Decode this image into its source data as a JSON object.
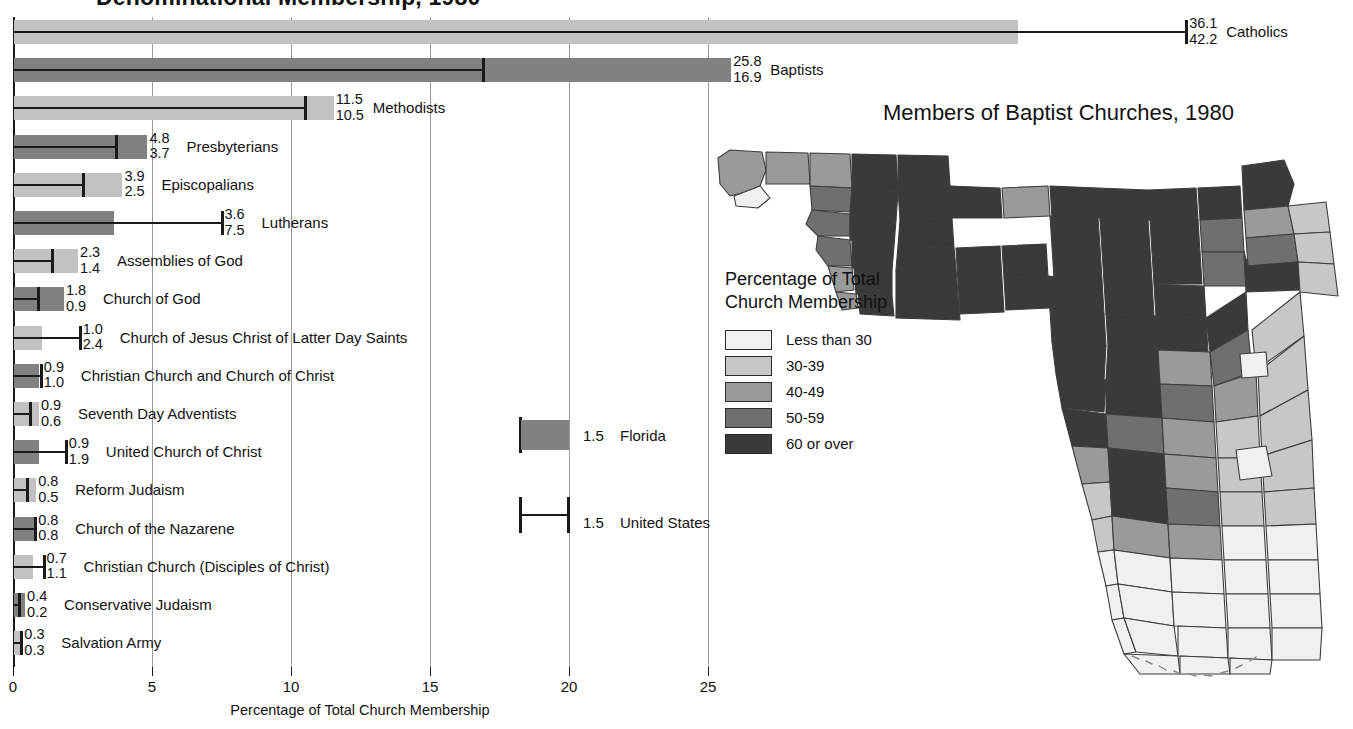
{
  "chart_data": {
    "type": "bar",
    "title": "Denominational Membership, 1980",
    "xlabel": "Percentage of Total Church Membership",
    "ylabel": "",
    "xlim": [
      0,
      26.5
    ],
    "xticks": [
      0,
      5,
      10,
      15,
      20,
      25
    ],
    "xticklabels": [
      "0",
      "5",
      "10",
      "15",
      "20",
      "25"
    ],
    "grid": true,
    "legend_position": "inside-center-right",
    "series": [
      {
        "name": "Florida",
        "kind": "bar"
      },
      {
        "name": "United States",
        "kind": "whisker-line"
      }
    ],
    "categories": [
      "Catholics",
      "Baptists",
      "Methodists",
      "Presbyterians",
      "Episcopalians",
      "Lutherans",
      "Assemblies of God",
      "Church of God",
      "Church of Jesus Christ of Latter Day Saints",
      "Christian Church and Church of Christ",
      "Seventh Day Adventists",
      "United Church of Christ",
      "Reform Judaism",
      "Church of the Nazarene",
      "Christian Church (Disciples of Christ)",
      "Conservative Judaism",
      "Salvation Army"
    ],
    "florida": [
      36.1,
      25.8,
      11.5,
      4.8,
      3.9,
      3.6,
      2.3,
      1.8,
      1.0,
      0.9,
      0.9,
      0.9,
      0.8,
      0.8,
      0.7,
      0.4,
      0.3
    ],
    "united_states": [
      42.2,
      16.9,
      10.5,
      3.7,
      2.5,
      7.5,
      1.4,
      0.9,
      2.4,
      1.0,
      0.6,
      1.9,
      0.5,
      0.8,
      1.1,
      0.2,
      0.3
    ]
  },
  "chart": {
    "title": "Denominational Membership, 1980",
    "x_axis_title": "Percentage of Total Church Membership",
    "ticks": [
      "0",
      "5",
      "10",
      "15",
      "20",
      "25"
    ],
    "rows": [
      {
        "label": "Catholics",
        "v1": "36.1",
        "v2": "42.2",
        "shade": "light"
      },
      {
        "label": "Baptists",
        "v1": "25.8",
        "v2": "16.9",
        "shade": "dark"
      },
      {
        "label": "Methodists",
        "v1": "11.5",
        "v2": "10.5",
        "shade": "light"
      },
      {
        "label": "Presbyterians",
        "v1": "4.8",
        "v2": "3.7",
        "shade": "dark"
      },
      {
        "label": "Episcopalians",
        "v1": "3.9",
        "v2": "2.5",
        "shade": "light"
      },
      {
        "label": "Lutherans",
        "v1": "3.6",
        "v2": "7.5",
        "shade": "dark"
      },
      {
        "label": "Assemblies of God",
        "v1": "2.3",
        "v2": "1.4",
        "shade": "light"
      },
      {
        "label": "Church of God",
        "v1": "1.8",
        "v2": "0.9",
        "shade": "dark"
      },
      {
        "label": "Church of Jesus Christ of Latter Day Saints",
        "v1": "1.0",
        "v2": "2.4",
        "shade": "light"
      },
      {
        "label": "Christian Church and Church of Christ",
        "v1": "0.9",
        "v2": "1.0",
        "shade": "dark"
      },
      {
        "label": "Seventh Day Adventists",
        "v1": "0.9",
        "v2": "0.6",
        "shade": "light"
      },
      {
        "label": "United Church of Christ",
        "v1": "0.9",
        "v2": "1.9",
        "shade": "dark"
      },
      {
        "label": "Reform Judaism",
        "v1": "0.8",
        "v2": "0.5",
        "shade": "light"
      },
      {
        "label": "Church of the Nazarene",
        "v1": "0.8",
        "v2": "0.8",
        "shade": "dark"
      },
      {
        "label": "Christian Church (Disciples of Christ)",
        "v1": "0.7",
        "v2": "1.1",
        "shade": "light"
      },
      {
        "label": "Conservative Judaism",
        "v1": "0.4",
        "v2": "0.2",
        "shade": "dark"
      },
      {
        "label": "Salvation Army",
        "v1": "0.3",
        "v2": "0.3",
        "shade": "light"
      }
    ],
    "legend": {
      "florida_value": "1.5",
      "florida_label": "Florida",
      "us_value": "1.5",
      "us_label": "United States"
    }
  },
  "map": {
    "title": "Members of Baptist Churches, 1980",
    "legend_title_line1": "Percentage of Total",
    "legend_title_line2": "Church Membership",
    "legend_classes": [
      {
        "label": "Less than 30",
        "color": "#f0f0f0"
      },
      {
        "label": "30-39",
        "color": "#c7c7c7"
      },
      {
        "label": "40-49",
        "color": "#9a9a9a"
      },
      {
        "label": "50-59",
        "color": "#6f6f6f"
      },
      {
        "label": "60 or over",
        "color": "#3a3a3a"
      }
    ]
  }
}
